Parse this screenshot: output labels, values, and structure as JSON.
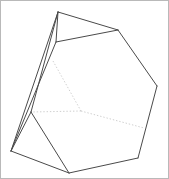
{
  "figure": {
    "kind": "3d-wireframe-polyhedron",
    "background_color": "#ffffff",
    "border_color": "#b9b9b9",
    "visible_edge_color": "#4a4a4a",
    "hidden_edge_color": "#c9c9c9",
    "canvas": {
      "width": 169,
      "height": 179
    }
  },
  "chart_data": {
    "type": "scatter",
    "xlabel": "",
    "ylabel": "",
    "grid": false,
    "legend": false,
    "xlim": [
      0,
      167
    ],
    "ylim": [
      0,
      177
    ],
    "vertices": [
      {
        "id": "A",
        "label": "apex-top",
        "x": 57,
        "y": 11
      },
      {
        "id": "B",
        "label": "upper-right",
        "x": 117,
        "y": 29
      },
      {
        "id": "C",
        "label": "right-upper-mid",
        "x": 156,
        "y": 85
      },
      {
        "id": "D",
        "label": "bottom-right",
        "x": 137,
        "y": 157
      },
      {
        "id": "E",
        "label": "bottom-mid",
        "x": 68,
        "y": 172
      },
      {
        "id": "F",
        "label": "left-lower",
        "x": 10,
        "y": 150
      },
      {
        "id": "G",
        "label": "left-mid",
        "x": 30,
        "y": 111
      },
      {
        "id": "H",
        "label": "upper-left-ridge",
        "x": 55,
        "y": 41
      },
      {
        "id": "I",
        "label": "hidden-center",
        "x": 80,
        "y": 110
      },
      {
        "id": "J",
        "label": "hidden-upper",
        "x": 52,
        "y": 60
      },
      {
        "id": "K",
        "label": "hidden-right",
        "x": 143,
        "y": 127
      }
    ],
    "visible_edges": [
      [
        "A",
        "B"
      ],
      [
        "B",
        "C"
      ],
      [
        "C",
        "D"
      ],
      [
        "D",
        "E"
      ],
      [
        "E",
        "F"
      ],
      [
        "F",
        "G"
      ],
      [
        "G",
        "E"
      ],
      [
        "G",
        "A"
      ],
      [
        "A",
        "H"
      ],
      [
        "H",
        "B"
      ],
      [
        "H",
        "F"
      ],
      [
        "F",
        "A"
      ]
    ],
    "hidden_edges": [
      [
        "J",
        "I"
      ],
      [
        "I",
        "G"
      ],
      [
        "I",
        "K"
      ]
    ]
  }
}
